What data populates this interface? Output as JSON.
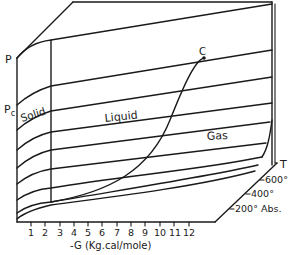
{
  "diagram": {
    "type": "3d-surface-phase-diagram",
    "labels": {
      "p_axis": "P",
      "pc": "P",
      "pc_sub": "c",
      "critical_point": "C",
      "solid": "Solid",
      "liquid": "Liquid",
      "gas": "Gas",
      "t_axis": "T"
    },
    "t_ticks": [
      "600°",
      "400°",
      "200° Abs."
    ],
    "x_axis": {
      "label": "-G (Kg.cal/mole)",
      "ticks": [
        "1",
        "2",
        "3",
        "4",
        "5",
        "6",
        "7",
        "8",
        "9",
        "10",
        "11",
        "12"
      ]
    },
    "colors": {
      "ink": "#1a1a1a",
      "background": "#ffffff"
    }
  }
}
